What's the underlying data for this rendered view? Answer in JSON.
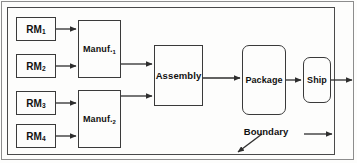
{
  "diagram": {
    "type": "block-flow",
    "boundary_label": "Boundary",
    "nodes": [
      {
        "id": "rm1",
        "label_main": "RM",
        "label_sub": "1",
        "shape": "rect",
        "x": 16,
        "y": 17,
        "w": 40,
        "h": 24,
        "font_size": 10
      },
      {
        "id": "rm2",
        "label_main": "RM",
        "label_sub": "2",
        "shape": "rect",
        "x": 16,
        "y": 54,
        "w": 40,
        "h": 24,
        "font_size": 10
      },
      {
        "id": "rm3",
        "label_main": "RM",
        "label_sub": "3",
        "shape": "rect",
        "x": 16,
        "y": 91,
        "w": 40,
        "h": 24,
        "font_size": 10
      },
      {
        "id": "rm4",
        "label_main": "RM",
        "label_sub": "4",
        "shape": "rect",
        "x": 16,
        "y": 124,
        "w": 40,
        "h": 24,
        "font_size": 10
      },
      {
        "id": "manuf1",
        "label_main": "Manuf.",
        "label_sub": "1",
        "shape": "rect",
        "x": 78,
        "y": 20,
        "w": 43,
        "h": 58,
        "font_size": 9
      },
      {
        "id": "manuf2",
        "label_main": "Manuf.",
        "label_sub": "2",
        "shape": "rect",
        "x": 78,
        "y": 90,
        "w": 43,
        "h": 58,
        "font_size": 9
      },
      {
        "id": "assembly",
        "label_main": "Assembly",
        "label_sub": "",
        "shape": "rect",
        "x": 154,
        "y": 45,
        "w": 49,
        "h": 61,
        "font_size": 9.5
      },
      {
        "id": "package",
        "label_main": "Package",
        "label_sub": "",
        "shape": "rounded",
        "x": 242,
        "y": 45,
        "w": 44,
        "h": 70,
        "font_size": 9
      },
      {
        "id": "ship",
        "label_main": "Ship",
        "label_sub": "",
        "shape": "rounded",
        "x": 303,
        "y": 57,
        "w": 28,
        "h": 46,
        "font_size": 9
      }
    ],
    "edges": [
      {
        "id": "e-rm1-manuf1",
        "from": "rm1",
        "to": "manuf1",
        "x1": 56,
        "y1": 29,
        "x2": 76,
        "y2": 29
      },
      {
        "id": "e-rm2-manuf1",
        "from": "rm2",
        "to": "manuf1",
        "x1": 56,
        "y1": 66,
        "x2": 76,
        "y2": 66
      },
      {
        "id": "e-rm3-manuf2",
        "from": "rm3",
        "to": "manuf2",
        "x1": 56,
        "y1": 103,
        "x2": 76,
        "y2": 103
      },
      {
        "id": "e-rm4-manuf2",
        "from": "rm4",
        "to": "manuf2",
        "x1": 56,
        "y1": 136,
        "x2": 76,
        "y2": 136
      },
      {
        "id": "e-manuf1-assembly",
        "from": "manuf1",
        "to": "assembly",
        "x1": 121,
        "y1": 64,
        "x2": 152,
        "y2": 64
      },
      {
        "id": "e-manuf2-assembly",
        "from": "manuf2",
        "to": "assembly",
        "x1": 121,
        "y1": 96,
        "x2": 152,
        "y2": 96
      },
      {
        "id": "e-assembly-package",
        "from": "assembly",
        "to": "package",
        "x1": 203,
        "y1": 78,
        "x2": 240,
        "y2": 78
      },
      {
        "id": "e-package-ship",
        "from": "package",
        "to": "ship",
        "x1": 286,
        "y1": 80,
        "x2": 301,
        "y2": 80
      },
      {
        "id": "e-ship-out",
        "from": "ship",
        "to": "outside",
        "x1": 331,
        "y1": 80,
        "x2": 352,
        "y2": 80
      }
    ],
    "boundary_pointer": {
      "label_x": 266,
      "label_y": 131,
      "lead_line": {
        "x1": 262,
        "y1": 134,
        "x2": 238,
        "y2": 152
      },
      "tail_line": {
        "x1": 304,
        "y1": 134,
        "x2": 332,
        "y2": 134
      }
    },
    "colors": {
      "stroke": "#3a3a3a",
      "boundary_stroke": "#4a4a4a",
      "frame_stroke": "#8d8d8d",
      "text": "#111111",
      "background": "#fdfdfc"
    }
  }
}
